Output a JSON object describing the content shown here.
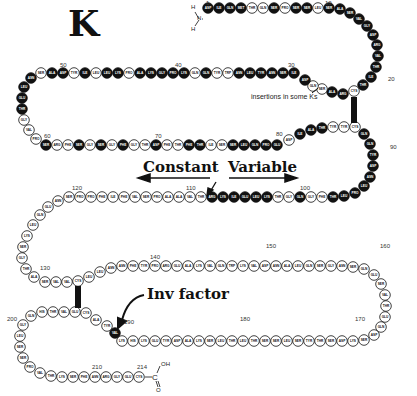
{
  "title": "K",
  "labels": {
    "constant": "Constant",
    "variable": "Variable",
    "inv_factor": "Inv factor",
    "insertions": "insertions in some Ks",
    "disulfide": "S-S"
  },
  "termini": {
    "n_terminus": {
      "h1": "H",
      "n": "N",
      "h2": "H"
    },
    "c_terminus": {
      "c": "C",
      "oh": "OH",
      "o": "O"
    }
  },
  "position_numbers": [
    "1",
    "10",
    "20",
    "30",
    "40",
    "50",
    "60",
    "70",
    "80",
    "90",
    "100",
    "110",
    "120",
    "130",
    "140",
    "150",
    "160",
    "170",
    "180",
    "190",
    "200",
    "210",
    "214"
  ],
  "colors": {
    "variable_fill": "#111111",
    "constant_fill": "#ffffff",
    "stroke": "#111111"
  },
  "beads": [
    {
      "x": 208,
      "y": 8,
      "aa": "ASP",
      "v": true
    },
    {
      "x": 219,
      "y": 8,
      "aa": "ILE",
      "v": true
    },
    {
      "x": 230,
      "y": 8,
      "aa": "GLN",
      "v": true
    },
    {
      "x": 241,
      "y": 8,
      "aa": "MET",
      "v": true
    },
    {
      "x": 252,
      "y": 8,
      "aa": "THR",
      "v": false
    },
    {
      "x": 263,
      "y": 8,
      "aa": "GLN",
      "v": false
    },
    {
      "x": 274,
      "y": 8,
      "aa": "SER",
      "v": true
    },
    {
      "x": 285,
      "y": 8,
      "aa": "PRO",
      "v": false
    },
    {
      "x": 296,
      "y": 8,
      "aa": "SER",
      "v": true
    },
    {
      "x": 307,
      "y": 8,
      "aa": "SER",
      "v": true
    },
    {
      "x": 318,
      "y": 8,
      "aa": "LEU",
      "v": false
    },
    {
      "x": 329,
      "y": 8,
      "aa": "SER",
      "v": true
    },
    {
      "x": 340,
      "y": 9,
      "aa": "ALA",
      "v": true
    },
    {
      "x": 350,
      "y": 13,
      "aa": "SER",
      "v": true
    },
    {
      "x": 359,
      "y": 19,
      "aa": "VAL",
      "v": true
    },
    {
      "x": 367,
      "y": 26,
      "aa": "GLY",
      "v": true
    },
    {
      "x": 373,
      "y": 35,
      "aa": "ASP",
      "v": true
    },
    {
      "x": 377,
      "y": 45,
      "aa": "ARG",
      "v": true
    },
    {
      "x": 378,
      "y": 56,
      "aa": "VAL",
      "v": true
    },
    {
      "x": 376,
      "y": 67,
      "aa": "THR",
      "v": true
    },
    {
      "x": 371,
      "y": 77,
      "aa": "ILE",
      "v": true
    },
    {
      "x": 363,
      "y": 85,
      "aa": "THR",
      "v": true
    },
    {
      "x": 354,
      "y": 91,
      "aa": "CYS",
      "v": false
    },
    {
      "x": 343,
      "y": 94,
      "aa": "ARG",
      "v": true
    },
    {
      "x": 332,
      "y": 92,
      "aa": "ALA",
      "v": true
    },
    {
      "x": 322,
      "y": 89,
      "aa": "SER",
      "v": false
    },
    {
      "x": 313,
      "y": 86,
      "aa": "GLN",
      "v": false
    },
    {
      "x": 305,
      "y": 80,
      "aa": "ASP",
      "v": true
    },
    {
      "x": 294,
      "y": 73,
      "aa": "ILE",
      "v": true
    },
    {
      "x": 283,
      "y": 73,
      "aa": "SER",
      "v": true
    },
    {
      "x": 272,
      "y": 73,
      "aa": "ASN",
      "v": true
    },
    {
      "x": 261,
      "y": 73,
      "aa": "TYR",
      "v": true
    },
    {
      "x": 250,
      "y": 73,
      "aa": "LEU",
      "v": true
    },
    {
      "x": 239,
      "y": 73,
      "aa": "ASN",
      "v": true
    },
    {
      "x": 228,
      "y": 73,
      "aa": "TRP",
      "v": false
    },
    {
      "x": 217,
      "y": 73,
      "aa": "TYR",
      "v": false
    },
    {
      "x": 206,
      "y": 73,
      "aa": "GLN",
      "v": true
    },
    {
      "x": 195,
      "y": 73,
      "aa": "GLN",
      "v": false
    },
    {
      "x": 184,
      "y": 73,
      "aa": "LYS",
      "v": true
    },
    {
      "x": 173,
      "y": 73,
      "aa": "PRO",
      "v": true
    },
    {
      "x": 162,
      "y": 73,
      "aa": "GLY",
      "v": true
    },
    {
      "x": 151,
      "y": 73,
      "aa": "LYS",
      "v": true
    },
    {
      "x": 140,
      "y": 73,
      "aa": "ALA",
      "v": true
    },
    {
      "x": 129,
      "y": 73,
      "aa": "PRO",
      "v": false
    },
    {
      "x": 118,
      "y": 73,
      "aa": "LYS",
      "v": true
    },
    {
      "x": 107,
      "y": 73,
      "aa": "LEU",
      "v": true
    },
    {
      "x": 96,
      "y": 73,
      "aa": "LEU",
      "v": false
    },
    {
      "x": 85,
      "y": 73,
      "aa": "ILE",
      "v": true
    },
    {
      "x": 74,
      "y": 73,
      "aa": "TYR",
      "v": false
    },
    {
      "x": 63,
      "y": 73,
      "aa": "ASP",
      "v": true
    },
    {
      "x": 52,
      "y": 73,
      "aa": "ALA",
      "v": true
    },
    {
      "x": 41,
      "y": 73,
      "aa": "SER",
      "v": false
    },
    {
      "x": 31,
      "y": 78,
      "aa": "ASN",
      "v": true
    },
    {
      "x": 24,
      "y": 87,
      "aa": "LEU",
      "v": true
    },
    {
      "x": 22,
      "y": 98,
      "aa": "GLU",
      "v": true
    },
    {
      "x": 22,
      "y": 109,
      "aa": "THR",
      "v": true
    },
    {
      "x": 24,
      "y": 120,
      "aa": "GLY",
      "v": false
    },
    {
      "x": 29,
      "y": 130,
      "aa": "VAL",
      "v": false
    },
    {
      "x": 36,
      "y": 139,
      "aa": "PRO",
      "v": false
    },
    {
      "x": 46,
      "y": 145,
      "aa": "SER",
      "v": true
    },
    {
      "x": 57,
      "y": 145,
      "aa": "ARG",
      "v": false
    },
    {
      "x": 68,
      "y": 145,
      "aa": "PHE",
      "v": false
    },
    {
      "x": 79,
      "y": 145,
      "aa": "SER",
      "v": true
    },
    {
      "x": 90,
      "y": 145,
      "aa": "GLY",
      "v": false
    },
    {
      "x": 101,
      "y": 145,
      "aa": "SER",
      "v": true
    },
    {
      "x": 112,
      "y": 145,
      "aa": "GLY",
      "v": false
    },
    {
      "x": 123,
      "y": 145,
      "aa": "PHE",
      "v": true
    },
    {
      "x": 134,
      "y": 145,
      "aa": "GLY",
      "v": false
    },
    {
      "x": 145,
      "y": 145,
      "aa": "THR",
      "v": false
    },
    {
      "x": 156,
      "y": 145,
      "aa": "ASP",
      "v": true
    },
    {
      "x": 167,
      "y": 145,
      "aa": "PHE",
      "v": false
    },
    {
      "x": 178,
      "y": 145,
      "aa": "THR",
      "v": false
    },
    {
      "x": 189,
      "y": 145,
      "aa": "PHE",
      "v": true
    },
    {
      "x": 200,
      "y": 145,
      "aa": "THR",
      "v": true
    },
    {
      "x": 211,
      "y": 145,
      "aa": "ILE",
      "v": false
    },
    {
      "x": 222,
      "y": 145,
      "aa": "SER",
      "v": false
    },
    {
      "x": 233,
      "y": 145,
      "aa": "SER",
      "v": true
    },
    {
      "x": 244,
      "y": 145,
      "aa": "LEU",
      "v": true
    },
    {
      "x": 255,
      "y": 145,
      "aa": "GLN",
      "v": true
    },
    {
      "x": 266,
      "y": 145,
      "aa": "PRO",
      "v": true
    },
    {
      "x": 277,
      "y": 145,
      "aa": "GLU",
      "v": true
    },
    {
      "x": 289,
      "y": 140,
      "aa": "ASP",
      "v": false
    },
    {
      "x": 300,
      "y": 134,
      "aa": "ILE",
      "v": true
    },
    {
      "x": 311,
      "y": 130,
      "aa": "ALA",
      "v": true
    },
    {
      "x": 322,
      "y": 128,
      "aa": "THR",
      "v": true
    },
    {
      "x": 333,
      "y": 127,
      "aa": "TYR",
      "v": false
    },
    {
      "x": 344,
      "y": 127,
      "aa": "TYR",
      "v": false
    },
    {
      "x": 355,
      "y": 127,
      "aa": "CYS",
      "v": false
    },
    {
      "x": 364,
      "y": 134,
      "aa": "GLN",
      "v": true
    },
    {
      "x": 370,
      "y": 144,
      "aa": "GLN",
      "v": true
    },
    {
      "x": 373,
      "y": 155,
      "aa": "TYR",
      "v": true
    },
    {
      "x": 373,
      "y": 166,
      "aa": "ASP",
      "v": true
    },
    {
      "x": 370,
      "y": 177,
      "aa": "ASN",
      "v": true
    },
    {
      "x": 364,
      "y": 186,
      "aa": "LEU",
      "v": true
    },
    {
      "x": 355,
      "y": 193,
      "aa": "PRO",
      "v": true
    },
    {
      "x": 344,
      "y": 196,
      "aa": "LEU",
      "v": true
    },
    {
      "x": 333,
      "y": 197,
      "aa": "THR",
      "v": true
    },
    {
      "x": 322,
      "y": 197,
      "aa": "PHE",
      "v": false
    },
    {
      "x": 311,
      "y": 197,
      "aa": "GLY",
      "v": false
    },
    {
      "x": 300,
      "y": 197,
      "aa": "GLN",
      "v": true
    },
    {
      "x": 289,
      "y": 197,
      "aa": "GLY",
      "v": false
    },
    {
      "x": 278,
      "y": 197,
      "aa": "THR",
      "v": false
    },
    {
      "x": 267,
      "y": 197,
      "aa": "LYS",
      "v": true
    },
    {
      "x": 256,
      "y": 197,
      "aa": "LEU",
      "v": true
    },
    {
      "x": 245,
      "y": 197,
      "aa": "GLU",
      "v": true
    },
    {
      "x": 234,
      "y": 197,
      "aa": "ILE",
      "v": true
    },
    {
      "x": 223,
      "y": 197,
      "aa": "LYS",
      "v": true
    },
    {
      "x": 212,
      "y": 197,
      "aa": "ARG",
      "v": true
    },
    {
      "x": 201,
      "y": 197,
      "aa": "THR",
      "v": false
    },
    {
      "x": 190,
      "y": 197,
      "aa": "VAL",
      "v": false
    },
    {
      "x": 179,
      "y": 197,
      "aa": "ALA",
      "v": false
    },
    {
      "x": 168,
      "y": 197,
      "aa": "ALA",
      "v": false
    },
    {
      "x": 157,
      "y": 197,
      "aa": "PRO",
      "v": false
    },
    {
      "x": 146,
      "y": 197,
      "aa": "SER",
      "v": false
    },
    {
      "x": 135,
      "y": 197,
      "aa": "VAL",
      "v": false
    },
    {
      "x": 124,
      "y": 197,
      "aa": "PHE",
      "v": false
    },
    {
      "x": 113,
      "y": 197,
      "aa": "ILE",
      "v": false
    },
    {
      "x": 102,
      "y": 197,
      "aa": "PHE",
      "v": false
    },
    {
      "x": 91,
      "y": 197,
      "aa": "PRO",
      "v": false
    },
    {
      "x": 80,
      "y": 197,
      "aa": "PRO",
      "v": false
    },
    {
      "x": 69,
      "y": 197,
      "aa": "SER",
      "v": false
    },
    {
      "x": 58,
      "y": 201,
      "aa": "ASN",
      "v": false
    },
    {
      "x": 48,
      "y": 207,
      "aa": "GLU",
      "v": false
    },
    {
      "x": 40,
      "y": 215,
      "aa": "GLN",
      "v": false
    },
    {
      "x": 33,
      "y": 225,
      "aa": "LEU",
      "v": false
    },
    {
      "x": 27,
      "y": 236,
      "aa": "LYS",
      "v": false
    },
    {
      "x": 23,
      "y": 247,
      "aa": "SER",
      "v": false
    },
    {
      "x": 22,
      "y": 258,
      "aa": "GLY",
      "v": false
    },
    {
      "x": 26,
      "y": 269,
      "aa": "THR",
      "v": false
    },
    {
      "x": 34,
      "y": 277,
      "aa": "ALA",
      "v": false
    },
    {
      "x": 45,
      "y": 282,
      "aa": "SER",
      "v": false
    },
    {
      "x": 56,
      "y": 282,
      "aa": "VAL",
      "v": false
    },
    {
      "x": 67,
      "y": 282,
      "aa": "VAL",
      "v": false
    },
    {
      "x": 78,
      "y": 281,
      "aa": "CYS",
      "v": false
    },
    {
      "x": 89,
      "y": 277,
      "aa": "LEU",
      "v": false
    },
    {
      "x": 100,
      "y": 272,
      "aa": "LEU",
      "v": false
    },
    {
      "x": 111,
      "y": 268,
      "aa": "ASN",
      "v": false
    },
    {
      "x": 122,
      "y": 266,
      "aa": "ASN",
      "v": false
    },
    {
      "x": 133,
      "y": 266,
      "aa": "PHE",
      "v": false
    },
    {
      "x": 144,
      "y": 266,
      "aa": "TYR",
      "v": false
    },
    {
      "x": 155,
      "y": 266,
      "aa": "PRO",
      "v": false
    },
    {
      "x": 166,
      "y": 266,
      "aa": "ARG",
      "v": false
    },
    {
      "x": 177,
      "y": 266,
      "aa": "GLU",
      "v": false
    },
    {
      "x": 188,
      "y": 266,
      "aa": "ALA",
      "v": false
    },
    {
      "x": 199,
      "y": 266,
      "aa": "LYS",
      "v": false
    },
    {
      "x": 210,
      "y": 266,
      "aa": "VAL",
      "v": false
    },
    {
      "x": 221,
      "y": 266,
      "aa": "GLN",
      "v": false
    },
    {
      "x": 232,
      "y": 266,
      "aa": "TRP",
      "v": false
    },
    {
      "x": 243,
      "y": 266,
      "aa": "LYS",
      "v": false
    },
    {
      "x": 254,
      "y": 266,
      "aa": "VAL",
      "v": false
    },
    {
      "x": 265,
      "y": 266,
      "aa": "ASP",
      "v": false
    },
    {
      "x": 276,
      "y": 266,
      "aa": "ASN",
      "v": false
    },
    {
      "x": 287,
      "y": 266,
      "aa": "ALA",
      "v": false
    },
    {
      "x": 298,
      "y": 266,
      "aa": "LEU",
      "v": false
    },
    {
      "x": 309,
      "y": 266,
      "aa": "GLN",
      "v": false
    },
    {
      "x": 320,
      "y": 266,
      "aa": "SER",
      "v": false
    },
    {
      "x": 331,
      "y": 266,
      "aa": "GLY",
      "v": false
    },
    {
      "x": 342,
      "y": 266,
      "aa": "ASN",
      "v": false
    },
    {
      "x": 353,
      "y": 267,
      "aa": "SER",
      "v": false
    },
    {
      "x": 364,
      "y": 269,
      "aa": "GLN",
      "v": false
    },
    {
      "x": 374,
      "y": 275,
      "aa": "GLU",
      "v": false
    },
    {
      "x": 381,
      "y": 284,
      "aa": "SER",
      "v": false
    },
    {
      "x": 385,
      "y": 295,
      "aa": "VAL",
      "v": false
    },
    {
      "x": 386,
      "y": 306,
      "aa": "THR",
      "v": false
    },
    {
      "x": 385,
      "y": 317,
      "aa": "GLU",
      "v": false
    },
    {
      "x": 381,
      "y": 327,
      "aa": "GLN",
      "v": false
    },
    {
      "x": 374,
      "y": 335,
      "aa": "ASP",
      "v": false
    },
    {
      "x": 364,
      "y": 340,
      "aa": "SER",
      "v": false
    },
    {
      "x": 353,
      "y": 341,
      "aa": "LYS",
      "v": false
    },
    {
      "x": 342,
      "y": 341,
      "aa": "ASP",
      "v": false
    },
    {
      "x": 331,
      "y": 341,
      "aa": "SER",
      "v": false
    },
    {
      "x": 320,
      "y": 341,
      "aa": "THR",
      "v": false
    },
    {
      "x": 309,
      "y": 341,
      "aa": "TYR",
      "v": false
    },
    {
      "x": 298,
      "y": 341,
      "aa": "SER",
      "v": false
    },
    {
      "x": 287,
      "y": 341,
      "aa": "LEU",
      "v": false
    },
    {
      "x": 276,
      "y": 341,
      "aa": "SER",
      "v": false
    },
    {
      "x": 265,
      "y": 341,
      "aa": "SER",
      "v": false
    },
    {
      "x": 254,
      "y": 341,
      "aa": "THR",
      "v": false
    },
    {
      "x": 243,
      "y": 341,
      "aa": "LEU",
      "v": false
    },
    {
      "x": 232,
      "y": 341,
      "aa": "THR",
      "v": false
    },
    {
      "x": 221,
      "y": 341,
      "aa": "LEU",
      "v": false
    },
    {
      "x": 210,
      "y": 341,
      "aa": "SER",
      "v": false
    },
    {
      "x": 199,
      "y": 341,
      "aa": "LYS",
      "v": false
    },
    {
      "x": 188,
      "y": 341,
      "aa": "ALA",
      "v": false
    },
    {
      "x": 177,
      "y": 341,
      "aa": "ASP",
      "v": false
    },
    {
      "x": 166,
      "y": 341,
      "aa": "TYR",
      "v": false
    },
    {
      "x": 155,
      "y": 341,
      "aa": "GLU",
      "v": false
    },
    {
      "x": 144,
      "y": 341,
      "aa": "LYS",
      "v": false
    },
    {
      "x": 133,
      "y": 341,
      "aa": "HIS",
      "v": false
    },
    {
      "x": 122,
      "y": 341,
      "aa": "LYS",
      "v": false
    },
    {
      "x": 115,
      "y": 333,
      "aa": "VAL",
      "v": true
    },
    {
      "x": 107,
      "y": 326,
      "aa": "TYR",
      "v": false
    },
    {
      "x": 96,
      "y": 320,
      "aa": "ALA",
      "v": false
    },
    {
      "x": 86,
      "y": 313,
      "aa": "CYS",
      "v": false
    },
    {
      "x": 75,
      "y": 312,
      "aa": "GLU",
      "v": false
    },
    {
      "x": 64,
      "y": 312,
      "aa": "VAL",
      "v": false
    },
    {
      "x": 53,
      "y": 312,
      "aa": "THR",
      "v": false
    },
    {
      "x": 42,
      "y": 312,
      "aa": "HIS",
      "v": false
    },
    {
      "x": 31,
      "y": 316,
      "aa": "GLN",
      "v": false
    },
    {
      "x": 23,
      "y": 325,
      "aa": "GLY",
      "v": false
    },
    {
      "x": 20,
      "y": 336,
      "aa": "LEU",
      "v": false
    },
    {
      "x": 20,
      "y": 347,
      "aa": "SER",
      "v": false
    },
    {
      "x": 23,
      "y": 358,
      "aa": "SER",
      "v": false
    },
    {
      "x": 30,
      "y": 367,
      "aa": "PRO",
      "v": false
    },
    {
      "x": 40,
      "y": 373,
      "aa": "VAL",
      "v": false
    },
    {
      "x": 51,
      "y": 376,
      "aa": "THR",
      "v": false
    },
    {
      "x": 62,
      "y": 377,
      "aa": "LYS",
      "v": false
    },
    {
      "x": 73,
      "y": 377,
      "aa": "SER",
      "v": false
    },
    {
      "x": 84,
      "y": 377,
      "aa": "PHE",
      "v": false
    },
    {
      "x": 95,
      "y": 377,
      "aa": "ASN",
      "v": false
    },
    {
      "x": 106,
      "y": 377,
      "aa": "ARG",
      "v": false
    },
    {
      "x": 117,
      "y": 377,
      "aa": "GLY",
      "v": false
    },
    {
      "x": 128,
      "y": 377,
      "aa": "GLU",
      "v": false
    },
    {
      "x": 139,
      "y": 377,
      "aa": "CYS",
      "v": false
    }
  ]
}
